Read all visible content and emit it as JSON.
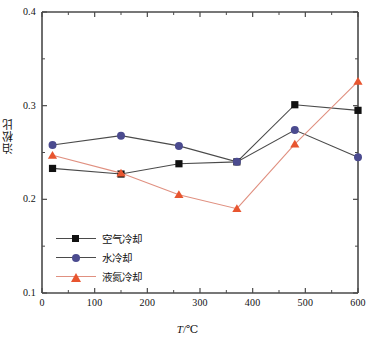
{
  "chart_data": {
    "type": "line",
    "title": "",
    "xlabel": "T/℃",
    "ylabel": "泊松比",
    "xlim": [
      0,
      600
    ],
    "ylim": [
      0.1,
      0.4
    ],
    "grid": false,
    "legend_position": "lower-left-inside",
    "x_ticks": [
      "0",
      "100",
      "200",
      "300",
      "400",
      "500",
      "600"
    ],
    "y_ticks": [
      "0.1",
      "0.2",
      "0.3",
      "0.4"
    ],
    "x_minor_ticks": [
      50,
      150,
      250,
      350,
      450,
      550
    ],
    "y_minor_ticks": [
      0.15,
      0.25,
      0.35
    ],
    "series": [
      {
        "name": "空气冷却",
        "marker": "square",
        "color": "#111111",
        "line_color": "#4a4a4a",
        "x": [
          20,
          150,
          260,
          370,
          480,
          600
        ],
        "y": [
          0.233,
          0.227,
          0.238,
          0.24,
          0.301,
          0.295
        ]
      },
      {
        "name": "水冷却",
        "marker": "circle",
        "color": "#4b4b8f",
        "line_color": "#4a4a4a",
        "x": [
          20,
          150,
          260,
          370,
          480,
          600
        ],
        "y": [
          0.258,
          0.268,
          0.257,
          0.24,
          0.274,
          0.245
        ]
      },
      {
        "name": "液氮冷却",
        "marker": "triangle",
        "color": "#e8552f",
        "line_color": "#e09080",
        "x": [
          20,
          150,
          260,
          370,
          480,
          600
        ],
        "y": [
          0.247,
          0.228,
          0.205,
          0.19,
          0.259,
          0.326
        ]
      }
    ]
  },
  "legend": {
    "items": [
      {
        "label": "空气冷却"
      },
      {
        "label": "水冷却"
      },
      {
        "label": "液氮冷却"
      }
    ]
  },
  "axes": {
    "x_title_symbol": "T",
    "x_title_unit": "/℃",
    "y_title": "泊松比"
  },
  "colors": {
    "air": "#111111",
    "water": "#4b4b8f",
    "nitrogen": "#e8552f",
    "axis": "#4a4a4a",
    "background": "#ffffff"
  }
}
